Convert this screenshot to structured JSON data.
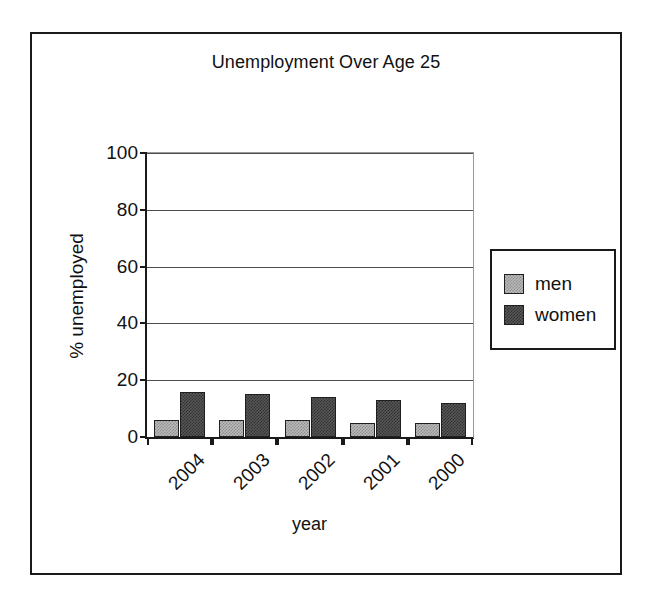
{
  "chart_data": {
    "type": "bar",
    "title": "Unemployment Over Age 25",
    "xlabel": "year",
    "ylabel": "% unemployed",
    "categories": [
      "2004",
      "2003",
      "2002",
      "2001",
      "2000"
    ],
    "series": [
      {
        "name": "men",
        "values": [
          6,
          6,
          6,
          5,
          5
        ],
        "color": "#b9b9b9"
      },
      {
        "name": "women",
        "values": [
          16,
          15,
          14,
          13,
          12
        ],
        "color": "#585858"
      }
    ],
    "ylim": [
      0,
      100
    ],
    "yticks": [
      0,
      20,
      40,
      60,
      80,
      100
    ],
    "ytick_labels": [
      "0",
      "20",
      "40",
      "60",
      "80",
      "100"
    ],
    "grid": true,
    "legend_position": "right",
    "xtick_rotation": -45
  },
  "legend": {
    "items": [
      {
        "label": "men"
      },
      {
        "label": "women"
      }
    ]
  }
}
